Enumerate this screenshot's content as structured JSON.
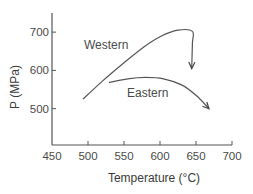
{
  "chart_data": {
    "type": "line",
    "title": "",
    "xlabel": "Temperature (°C)",
    "ylabel": "P (MPa)",
    "xlim": [
      450,
      700
    ],
    "ylim": [
      405,
      750
    ],
    "xticks": [
      450,
      500,
      550,
      600,
      650,
      700
    ],
    "yticks": [
      500,
      600,
      700
    ],
    "xtick_labels": [
      "450",
      "500",
      "550",
      "600",
      "650",
      "700"
    ],
    "ytick_labels": [
      "500",
      "600",
      "700"
    ],
    "grid": false,
    "legend": "none (inline series labels)",
    "series": [
      {
        "name": "Western",
        "label": "Western",
        "arrow_at_end": true,
        "points": [
          {
            "x": 493,
            "y": 525
          },
          {
            "x": 520,
            "y": 572
          },
          {
            "x": 550,
            "y": 620
          },
          {
            "x": 578,
            "y": 662
          },
          {
            "x": 600,
            "y": 688
          },
          {
            "x": 625,
            "y": 705
          },
          {
            "x": 645,
            "y": 702
          },
          {
            "x": 645,
            "y": 670
          },
          {
            "x": 644,
            "y": 605
          }
        ]
      },
      {
        "name": "Eastern",
        "label": "Eastern",
        "arrow_at_end": true,
        "points": [
          {
            "x": 529,
            "y": 568
          },
          {
            "x": 555,
            "y": 578
          },
          {
            "x": 580,
            "y": 582
          },
          {
            "x": 605,
            "y": 578
          },
          {
            "x": 630,
            "y": 562
          },
          {
            "x": 650,
            "y": 535
          },
          {
            "x": 668,
            "y": 500
          }
        ]
      }
    ]
  }
}
